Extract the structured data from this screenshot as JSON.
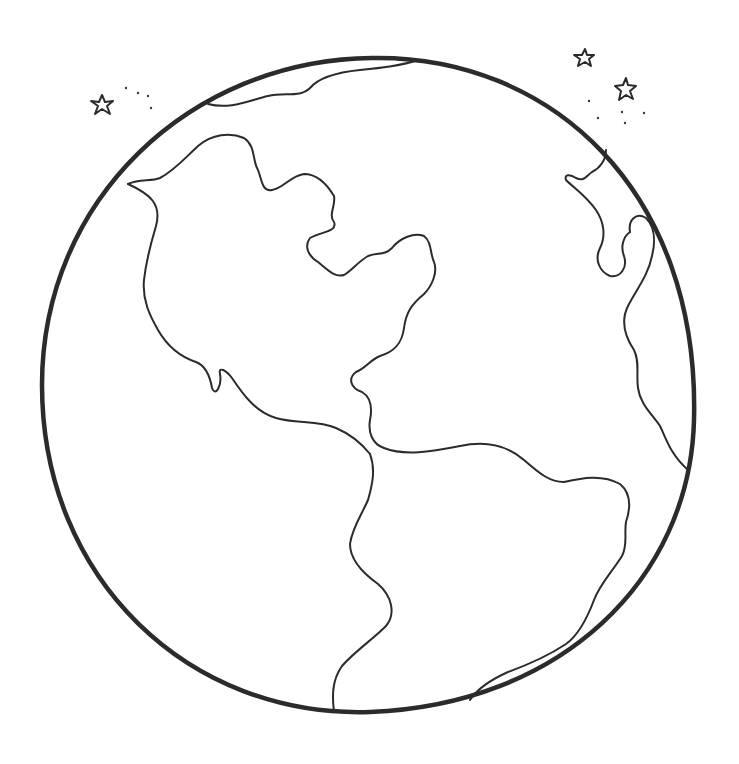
{
  "image": {
    "subject": "Earth globe coloring page",
    "style": "black line art on white",
    "colors": {
      "line": "#2b2b2b",
      "background": "#ffffff"
    },
    "elements": [
      "globe-outline",
      "north-america",
      "south-america",
      "greenland-top",
      "europe-africa-edge",
      "stars",
      "dots"
    ],
    "star_count": 3
  }
}
